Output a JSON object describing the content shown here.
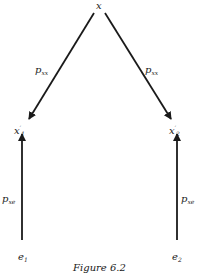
{
  "diagram": {
    "type": "path-diagram",
    "nodes": {
      "x": {
        "label": "x"
      },
      "x1": {
        "label": "x",
        "prime": "′",
        "sub": "1"
      },
      "x2": {
        "label": "x",
        "prime": "′",
        "sub": "2"
      },
      "e1": {
        "label": "e",
        "sub": "1"
      },
      "e2": {
        "label": "e",
        "sub": "2"
      }
    },
    "edges": {
      "x_to_x1": {
        "label": "p",
        "sub": "xx"
      },
      "x_to_x2": {
        "label": "p",
        "sub": "xx"
      },
      "e1_to_x1": {
        "label": "p",
        "sub": "xe"
      },
      "e2_to_x2": {
        "label": "p",
        "sub": "xe"
      }
    },
    "caption": "Figure 6.2"
  },
  "colors": {
    "ink": "#1a1a1a",
    "background": "#ffffff"
  }
}
